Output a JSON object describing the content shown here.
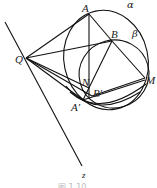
{
  "diagram": {
    "type": "geometry-figure",
    "points": {
      "A": {
        "label": "A",
        "x": 89,
        "y": 14
      },
      "B": {
        "label": "B",
        "x": 112,
        "y": 41
      },
      "M": {
        "label": "M",
        "x": 145,
        "y": 78
      },
      "Q": {
        "label": "Q",
        "x": 26,
        "y": 58
      },
      "N": {
        "label": "N",
        "x": 89,
        "y": 88
      },
      "Bp": {
        "label": "B′",
        "x": 92,
        "y": 96
      },
      "Ap": {
        "label": "A′",
        "x": 83,
        "y": 100
      }
    },
    "circles": {
      "alpha": {
        "label": "α"
      },
      "beta": {
        "label": "β"
      }
    },
    "line_z": {
      "label": "z"
    },
    "caption": "图 1.10"
  }
}
